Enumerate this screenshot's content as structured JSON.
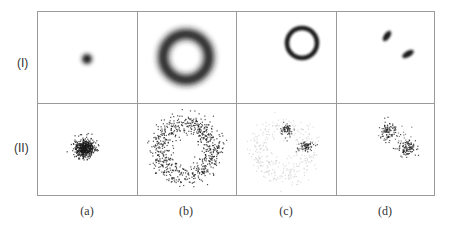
{
  "figure": {
    "row_labels": [
      "(I)",
      "(II)"
    ],
    "col_labels": [
      "(a)",
      "(b)",
      "(c)",
      "(d)"
    ],
    "rows": [
      {
        "label": "(I)",
        "kind": "density",
        "panels": [
          {
            "col": "(a)",
            "shape": "blob",
            "description": "small dark blob"
          },
          {
            "col": "(b)",
            "shape": "ring",
            "description": "large blurred ring"
          },
          {
            "col": "(c)",
            "shape": "ring",
            "description": "small sharp ring, upper right"
          },
          {
            "col": "(d)",
            "shape": "two-clusters",
            "description": "two elongated dark blobs"
          }
        ]
      },
      {
        "label": "(II)",
        "kind": "samples",
        "panels": [
          {
            "col": "(a)",
            "shape": "cluster",
            "description": "dense point cluster"
          },
          {
            "col": "(b)",
            "shape": "ring",
            "description": "scattered points forming a ring"
          },
          {
            "col": "(c)",
            "shape": "faint-ring-with-clusters",
            "description": "faint ring with two dark clusters"
          },
          {
            "col": "(d)",
            "shape": "two-clusters",
            "description": "two point clusters"
          }
        ]
      }
    ],
    "colors": {
      "grid": "#9a9a9a",
      "ink": "#1a1a1a",
      "faint": "#c8c8c8"
    }
  }
}
